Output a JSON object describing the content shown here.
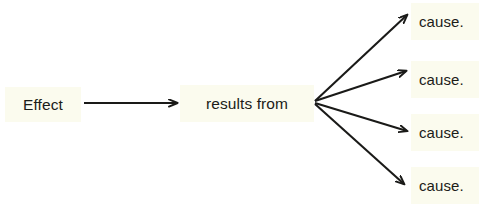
{
  "diagram": {
    "type": "cause-effect-flow",
    "background_color": "#ffffff",
    "node_fill_color": "#fbfbee",
    "edge_color": "#1a1a18",
    "text_color": "#1c1c18",
    "nodes": {
      "effect": {
        "label": "Effect"
      },
      "middle": {
        "label": "results from"
      },
      "causes": [
        {
          "label": "cause."
        },
        {
          "label": "cause."
        },
        {
          "label": "cause."
        },
        {
          "label": "cause."
        }
      ]
    },
    "edges": [
      {
        "from": "effect",
        "to": "middle",
        "style": "straight-arrow"
      },
      {
        "from": "middle",
        "to": "cause-1",
        "style": "straight-arrow"
      },
      {
        "from": "middle",
        "to": "cause-2",
        "style": "straight-arrow"
      },
      {
        "from": "middle",
        "to": "cause-3",
        "style": "straight-arrow"
      },
      {
        "from": "middle",
        "to": "cause-4",
        "style": "straight-arrow"
      }
    ]
  }
}
